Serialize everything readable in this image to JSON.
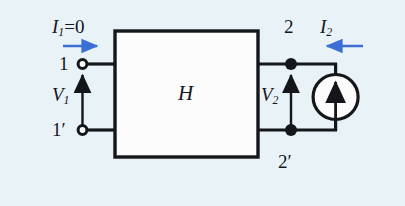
{
  "figure": {
    "type": "two-port-network-circuit",
    "background_color": "#e9f2f7",
    "wire_color": "#15161a",
    "current_arrow_color": "#3b6fd4"
  },
  "network_block": {
    "label": "H",
    "fill": "#fbfcfb",
    "stroke": "#15161a"
  },
  "input_port": {
    "current_label_base": "I",
    "current_label_sub": "1",
    "current_label_suffix": "=0",
    "current_label_full": "I1=0",
    "current_direction": "right",
    "voltage_label_base": "V",
    "voltage_label_sub": "1",
    "voltage_arrow_direction": "up",
    "top_terminal_label": "1",
    "bottom_terminal_label": "1′",
    "terminal_style": "open-circle"
  },
  "output_port": {
    "current_label_base": "I",
    "current_label_sub": "2",
    "current_direction": "left",
    "voltage_label_base": "V",
    "voltage_label_sub": "2",
    "voltage_arrow_direction": "up",
    "top_terminal_label": "2",
    "bottom_terminal_label": "2′",
    "terminal_style": "filled-dot"
  },
  "source": {
    "type": "current-source",
    "symbol": "circle-with-up-arrow",
    "arrow_direction": "up"
  }
}
